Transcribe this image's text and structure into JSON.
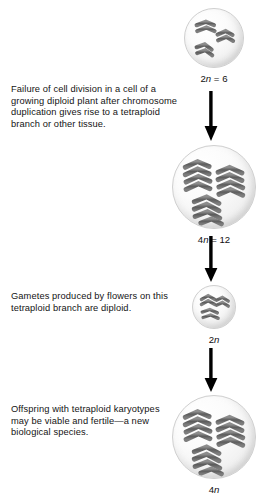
{
  "figure": {
    "background_color": "#ffffff",
    "chromosome_color": "#6e6e6e",
    "chromosome_dark": "#4f4f4f",
    "arrow_color": "#000000"
  },
  "captions": [
    {
      "id": "caption-1",
      "text": "Failure of cell division in a cell of a growing diploid plant after chromosome duplication gives rise to a tetraploid branch or other tissue."
    },
    {
      "id": "caption-2",
      "text": "Gametes produced by flowers on this tetraploid branch are diploid."
    },
    {
      "id": "caption-3",
      "text": "Offspring with tetraploid karyotypes may be viable and fertile—a new biological species."
    }
  ],
  "cells": [
    {
      "id": "cell-1",
      "label_prefix": "2",
      "label_italic": "n",
      "label_suffix": " = 6",
      "label_full": "2n = 6",
      "chromosome_count": 6,
      "ploidy": "diploid"
    },
    {
      "id": "cell-2",
      "label_prefix": "4",
      "label_italic": "n",
      "label_suffix": " = 12",
      "label_full": "4n = 12",
      "chromosome_count": 12,
      "ploidy": "tetraploid"
    },
    {
      "id": "cell-3",
      "label_prefix": "2",
      "label_italic": "n",
      "label_suffix": "",
      "label_full": "2n",
      "chromosome_count": 6,
      "ploidy": "diploid"
    },
    {
      "id": "cell-4",
      "label_prefix": "4",
      "label_italic": "n",
      "label_suffix": "",
      "label_full": "4n",
      "chromosome_count": 12,
      "ploidy": "tetraploid"
    }
  ],
  "arrows": [
    {
      "id": "arrow-1",
      "direction": "down"
    },
    {
      "id": "arrow-2",
      "direction": "down"
    },
    {
      "id": "arrow-3",
      "direction": "down"
    }
  ]
}
